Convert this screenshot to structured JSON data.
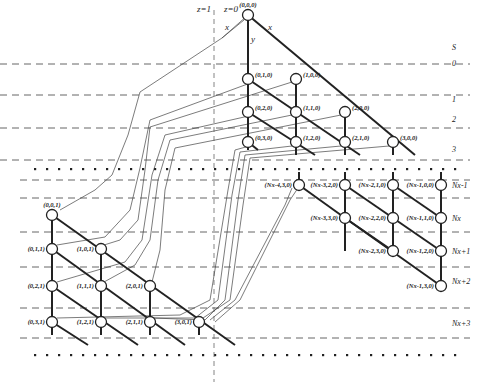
{
  "diagram": {
    "layer_labels": {
      "z1": "z=1",
      "z0": "z=0"
    },
    "edge_labels": {
      "x_left": "x",
      "x_right": "x",
      "y": "y"
    },
    "s_header": "S",
    "row_labels": [
      "0",
      "1",
      "2",
      "3",
      "Nx-1",
      "Nx",
      "Nx+1",
      "Nx+2",
      "Nx+3"
    ],
    "nodes_z0_top": [
      {
        "id": "n000",
        "label": "(0,0,0)"
      },
      {
        "id": "n010",
        "label": "(0,1,0)"
      },
      {
        "id": "n100",
        "label": "(1,0,0)"
      },
      {
        "id": "n020",
        "label": "(0,2,0)"
      },
      {
        "id": "n110",
        "label": "(1,1,0)"
      },
      {
        "id": "n200",
        "label": "(2,0,0)"
      },
      {
        "id": "n030",
        "label": "(0,3,0)"
      },
      {
        "id": "n120",
        "label": "(1,2,0)"
      },
      {
        "id": "n210",
        "label": "(2,1,0)"
      },
      {
        "id": "n300",
        "label": "(3,0,0)"
      }
    ],
    "nodes_z0_bottom": [
      {
        "id": "nx430",
        "label": "(Nx-4,3,0)"
      },
      {
        "id": "nx320",
        "label": "(Nx-3,2,0)"
      },
      {
        "id": "nx210",
        "label": "(Nx-2,1,0)"
      },
      {
        "id": "nx100",
        "label": "(Nx-1,0,0)"
      },
      {
        "id": "nx330",
        "label": "(Nx-3,3,0)"
      },
      {
        "id": "nx220",
        "label": "(Nx-2,2,0)"
      },
      {
        "id": "nx110",
        "label": "(Nx-1,1,0)"
      },
      {
        "id": "nx230",
        "label": "(Nx-2,3,0)"
      },
      {
        "id": "nx120",
        "label": "(Nx-1,2,0)"
      },
      {
        "id": "nx130",
        "label": "(Nx-1,3,0)"
      }
    ],
    "nodes_z1": [
      {
        "id": "n001",
        "label": "(0,0,1)"
      },
      {
        "id": "n011",
        "label": "(0,1,1)"
      },
      {
        "id": "n101",
        "label": "(1,0,1)"
      },
      {
        "id": "n021",
        "label": "(0,2,1)"
      },
      {
        "id": "n111",
        "label": "(1,1,1)"
      },
      {
        "id": "n201",
        "label": "(2,0,1)"
      },
      {
        "id": "n031",
        "label": "(0,3,1)"
      },
      {
        "id": "n121",
        "label": "(1,2,1)"
      },
      {
        "id": "n211",
        "label": "(2,1,1)"
      },
      {
        "id": "n301",
        "label": "(3,0,1)"
      }
    ]
  }
}
